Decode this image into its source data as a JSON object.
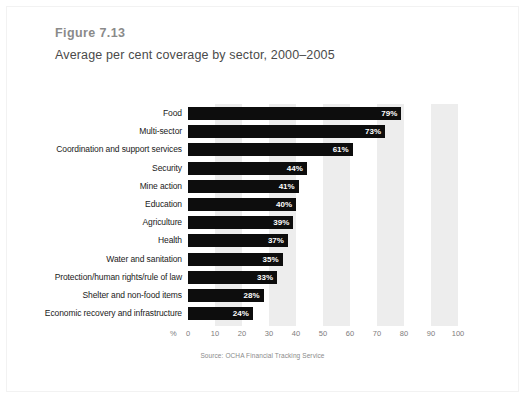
{
  "figure": {
    "number": "Figure 7.13",
    "title": "Average per cent coverage by sector, 2000–2005",
    "source": "Source: OCHA Financial Tracking Service"
  },
  "axis": {
    "unit_label": "%",
    "tick_labels": [
      "0",
      "10",
      "20",
      "30",
      "40",
      "50",
      "60",
      "70",
      "80",
      "90",
      "100"
    ]
  },
  "colors": {
    "bar": "#0d0d0d",
    "band": "#ededed",
    "background": "#ffffff",
    "figure_number_text": "#8a8a8a",
    "title_text": "#4a4a4a",
    "axis_text": "#7d7d7d",
    "value_label_text": "#ffffff"
  },
  "chart_data": {
    "type": "bar",
    "orientation": "horizontal",
    "title": "Average per cent coverage by sector, 2000–2005",
    "xlabel": "%",
    "ylabel": "",
    "xlim": [
      0,
      100
    ],
    "grid": false,
    "legend": "none",
    "categories": [
      "Food",
      "Multi-sector",
      "Coordination and support services",
      "Security",
      "Mine action",
      "Education",
      "Agriculture",
      "Health",
      "Water and sanitation",
      "Protection/human rights/rule of law",
      "Shelter and non-food items",
      "Economic recovery and infrastructure"
    ],
    "values": [
      79,
      73,
      61,
      44,
      41,
      40,
      39,
      37,
      35,
      33,
      28,
      24
    ],
    "value_labels": [
      "79%",
      "73%",
      "61%",
      "44%",
      "41%",
      "40%",
      "39%",
      "37%",
      "35%",
      "33%",
      "28%",
      "24%"
    ],
    "tick_values": [
      0,
      10,
      20,
      30,
      40,
      50,
      60,
      70,
      80,
      90,
      100
    ],
    "source": "Source: OCHA Financial Tracking Service"
  }
}
